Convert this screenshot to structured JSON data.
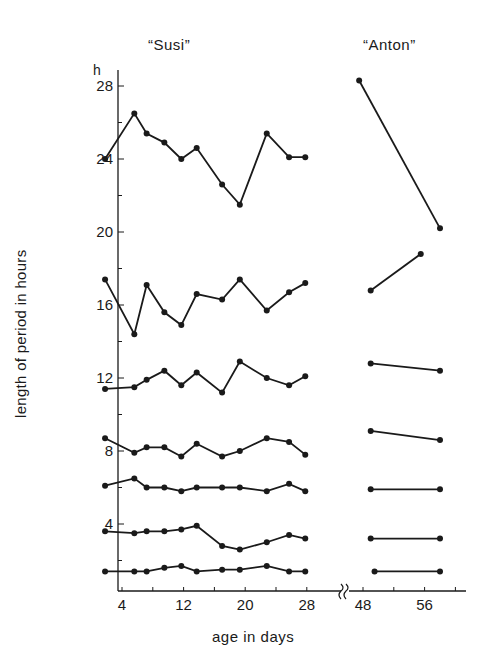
{
  "chart_data": {
    "type": "line",
    "title": "",
    "panels": [
      {
        "name": "“Susi”",
        "x_range": [
          2,
          28
        ]
      },
      {
        "name": "“Anton”",
        "x_range": [
          47,
          58
        ]
      }
    ],
    "xlabel": "age in days",
    "ylabel": "length of period in hours",
    "y_unit": "h",
    "ylim": [
      0,
      29
    ],
    "x_ticks": [
      4,
      12,
      20,
      28,
      48,
      56
    ],
    "y_ticks": [
      4,
      8,
      12,
      16,
      20,
      24,
      28
    ],
    "axis_break": "between 28 and 48",
    "grid": false,
    "legend": "none",
    "series": [
      {
        "name": "Susi component 1",
        "x": [
          1.8,
          5.6,
          7.2,
          9.5,
          11.7,
          13.7,
          17.0,
          19.3,
          22.8,
          25.7,
          27.8
        ],
        "values": [
          24.0,
          26.5,
          25.4,
          24.9,
          24.0,
          24.6,
          22.6,
          21.5,
          25.4,
          24.1,
          24.1
        ]
      },
      {
        "name": "Susi component 2",
        "x": [
          1.8,
          5.6,
          7.2,
          9.5,
          11.7,
          13.7,
          17.0,
          19.3,
          22.8,
          25.7,
          27.8
        ],
        "values": [
          17.4,
          14.4,
          17.1,
          15.6,
          14.9,
          16.6,
          16.3,
          17.4,
          15.7,
          16.7,
          17.2
        ]
      },
      {
        "name": "Susi component 3",
        "x": [
          1.8,
          5.6,
          7.2,
          9.5,
          11.7,
          13.7,
          17.0,
          19.3,
          22.8,
          25.7,
          27.8
        ],
        "values": [
          11.4,
          11.5,
          11.9,
          12.4,
          11.6,
          12.3,
          11.2,
          12.9,
          12.0,
          11.6,
          12.1
        ]
      },
      {
        "name": "Susi component 4",
        "x": [
          1.8,
          5.6,
          7.2,
          9.5,
          11.7,
          13.7,
          17.0,
          19.3,
          22.8,
          25.7,
          27.8
        ],
        "values": [
          8.7,
          7.9,
          8.2,
          8.2,
          7.7,
          8.4,
          7.7,
          8.0,
          8.7,
          8.5,
          7.8
        ]
      },
      {
        "name": "Susi component 5",
        "x": [
          1.8,
          5.6,
          7.2,
          9.5,
          11.7,
          13.7,
          17.0,
          19.3,
          22.8,
          25.7,
          27.8
        ],
        "values": [
          6.1,
          6.5,
          6.0,
          6.0,
          5.8,
          6.0,
          6.0,
          6.0,
          5.8,
          6.2,
          5.8
        ]
      },
      {
        "name": "Susi component 6",
        "x": [
          1.8,
          5.6,
          7.2,
          9.5,
          11.7,
          13.7,
          17.0,
          19.3,
          22.8,
          25.7,
          27.8
        ],
        "values": [
          3.6,
          3.5,
          3.6,
          3.6,
          3.7,
          3.9,
          2.8,
          2.6,
          3.0,
          3.4,
          3.2
        ]
      },
      {
        "name": "Susi component 7",
        "x": [
          1.8,
          5.6,
          7.2,
          9.5,
          11.7,
          13.7,
          17.0,
          19.3,
          22.8,
          25.7,
          27.8
        ],
        "values": [
          1.4,
          1.4,
          1.4,
          1.6,
          1.7,
          1.4,
          1.5,
          1.5,
          1.7,
          1.4,
          1.4
        ]
      },
      {
        "name": "Anton component 1",
        "x": [
          47.5,
          58.0
        ],
        "values": [
          28.3,
          20.2
        ]
      },
      {
        "name": "Anton component 2",
        "x": [
          49.0,
          55.5
        ],
        "values": [
          16.8,
          18.8
        ]
      },
      {
        "name": "Anton component 3",
        "x": [
          49.0,
          58.0
        ],
        "values": [
          12.8,
          12.4
        ]
      },
      {
        "name": "Anton component 4",
        "x": [
          49.0,
          58.0
        ],
        "values": [
          9.1,
          8.6
        ]
      },
      {
        "name": "Anton component 5",
        "x": [
          49.0,
          58.0
        ],
        "values": [
          5.9,
          5.9
        ]
      },
      {
        "name": "Anton component 6",
        "x": [
          49.0,
          58.0
        ],
        "values": [
          3.2,
          3.2
        ]
      },
      {
        "name": "Anton component 7",
        "x": [
          49.5,
          58.0
        ],
        "values": [
          1.4,
          1.4
        ]
      }
    ]
  },
  "labels": {
    "susi": "“Susi”",
    "anton": "“Anton”",
    "unit": "h",
    "ylabel": "length of period in hours",
    "xlabel": "age in days"
  }
}
